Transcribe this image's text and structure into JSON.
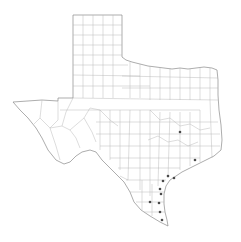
{
  "map": {
    "region": "Texas",
    "type": "county outline map",
    "colors": {
      "background": "#ffffff",
      "state_outline": "#8a8a8a",
      "county_lines": "#b4b4b4",
      "marker": "#4a4a4a"
    },
    "markers": [
      {
        "x": 180,
        "y": 132
      },
      {
        "x": 195,
        "y": 160
      },
      {
        "x": 168,
        "y": 176
      },
      {
        "x": 174,
        "y": 178
      },
      {
        "x": 163,
        "y": 181
      },
      {
        "x": 160,
        "y": 189
      },
      {
        "x": 161,
        "y": 194
      },
      {
        "x": 150,
        "y": 202
      },
      {
        "x": 159,
        "y": 203
      },
      {
        "x": 160,
        "y": 212
      },
      {
        "x": 162,
        "y": 220
      }
    ]
  }
}
